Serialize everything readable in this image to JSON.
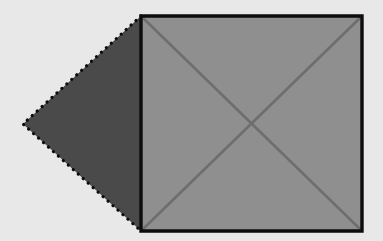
{
  "figure": {
    "canvas": {
      "width": 383,
      "height": 241,
      "background_color": "#e8e8e8"
    },
    "shapes": {
      "square": {
        "name": "square",
        "fill_color": "#8f8f8f",
        "stroke_color": "#0d0d0d",
        "stroke_width": 3.4,
        "stroke_style": "solid",
        "points": "141,16 362,16 362,231 141,231",
        "corners": {
          "top_left": [
            141,
            16
          ],
          "top_right": [
            362,
            16
          ],
          "bottom_right": [
            362,
            231
          ],
          "bottom_left": [
            141,
            231
          ]
        },
        "side_length_px": 218
      },
      "triangle": {
        "name": "triangle",
        "fill_color": "#4a4a4a",
        "stroke_color": "#0d0d0d",
        "stroke_width": 3.2,
        "stroke_style": "dotted",
        "stroke_dasharray": "0.1 6.6",
        "points": "23,124 141,16 141,231",
        "apex": [
          23,
          124
        ],
        "base_top": [
          141,
          16
        ],
        "base_bottom": [
          141,
          231
        ],
        "orientation": "points-left"
      },
      "diagonal_main": {
        "name": "diagonal-top-left-to-bottom-right",
        "stroke_color": "#6e6e6e",
        "stroke_width": 2.6,
        "from": [
          142,
          17
        ],
        "to": [
          361,
          230
        ]
      },
      "diagonal_anti": {
        "name": "diagonal-bottom-left-to-top-right",
        "stroke_color": "#6e6e6e",
        "stroke_width": 2.6,
        "from": [
          142,
          230
        ],
        "to": [
          361,
          17
        ]
      },
      "diagonal_intersection": {
        "name": "diagonal-intersection-point",
        "point": [
          251,
          123
        ]
      }
    },
    "colors": {
      "background": "#e8e8e8",
      "square_fill": "#8f8f8f",
      "triangle_fill": "#4a4a4a",
      "outline": "#0d0d0d",
      "diagonal": "#6e6e6e"
    }
  }
}
